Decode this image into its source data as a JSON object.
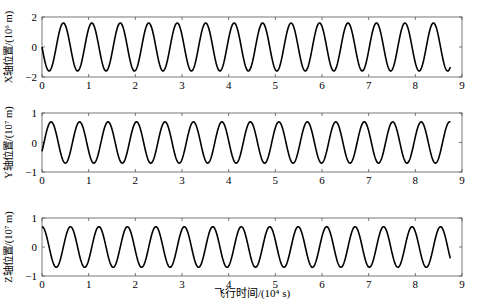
{
  "figure": {
    "xlabel": "飞行时间/(10⁴ s)",
    "panels": [
      {
        "ylabel": "X轴位置/(10⁶ m)",
        "yticks": [
          "2",
          "0",
          "−2"
        ],
        "xticks": [
          "0",
          "1",
          "2",
          "3",
          "4",
          "5",
          "6",
          "7",
          "8",
          "9"
        ]
      },
      {
        "ylabel": "Y轴位置/(10⁷ m)",
        "yticks": [
          "1",
          "0",
          "−1"
        ],
        "xticks": [
          "0",
          "1",
          "2",
          "3",
          "4",
          "5",
          "6",
          "7",
          "8",
          "9"
        ]
      },
      {
        "ylabel": "Z轴位置/(10⁷ m)",
        "yticks": [
          "1",
          "0",
          "−1"
        ],
        "xticks": [
          "0",
          "1",
          "2",
          "3",
          "4",
          "5",
          "6",
          "7",
          "8",
          "9"
        ]
      }
    ]
  },
  "chart_data": [
    {
      "type": "line",
      "title": "",
      "xlabel": "飞行时间/(10⁴ s)",
      "ylabel": "X轴位置/(10⁶ m)",
      "xlim": [
        0,
        9
      ],
      "ylim": [
        -2,
        2
      ],
      "xticks": [
        0,
        1,
        2,
        3,
        4,
        5,
        6,
        7,
        8,
        9
      ],
      "yticks": [
        -2,
        0,
        2
      ],
      "grid": false,
      "series": [
        {
          "name": "X",
          "form": "sinusoid",
          "amplitude": 1.6,
          "period": 0.61,
          "phase_start_value": 0.0,
          "initial_direction": "down",
          "x_range": [
            0,
            8.75
          ],
          "end_value": 0.9
        }
      ]
    },
    {
      "type": "line",
      "title": "",
      "xlabel": "飞行时间/(10⁴ s)",
      "ylabel": "Y轴位置/(10⁷ m)",
      "xlim": [
        0,
        9
      ],
      "ylim": [
        -1,
        1
      ],
      "xticks": [
        0,
        1,
        2,
        3,
        4,
        5,
        6,
        7,
        8,
        9
      ],
      "yticks": [
        -1,
        0,
        1
      ],
      "grid": false,
      "series": [
        {
          "name": "Y",
          "form": "sinusoid",
          "amplitude": 0.7,
          "period": 0.61,
          "phase_start_value": -0.3,
          "initial_direction": "up",
          "x_range": [
            0,
            8.75
          ],
          "end_value": -0.05
        }
      ]
    },
    {
      "type": "line",
      "title": "",
      "xlabel": "飞行时间/(10⁴ s)",
      "ylabel": "Z轴位置/(10⁷ m)",
      "xlim": [
        0,
        9
      ],
      "ylim": [
        -1,
        1
      ],
      "xticks": [
        0,
        1,
        2,
        3,
        4,
        5,
        6,
        7,
        8,
        9
      ],
      "yticks": [
        -1,
        0,
        1
      ],
      "grid": false,
      "series": [
        {
          "name": "Z",
          "form": "sinusoid",
          "amplitude": 0.7,
          "period": 0.61,
          "phase_start_value": 0.7,
          "initial_direction": "flat-then-down",
          "x_range": [
            0,
            8.75
          ],
          "end_value": -0.45
        }
      ]
    }
  ]
}
